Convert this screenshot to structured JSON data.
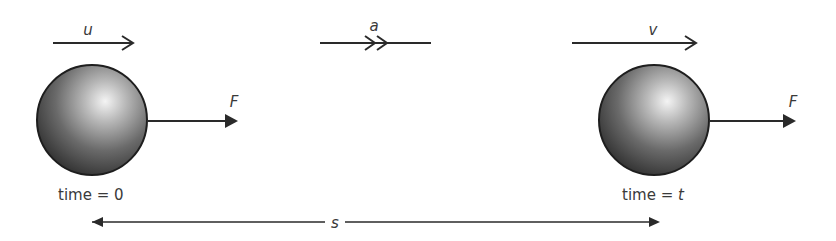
{
  "diagram": {
    "type": "physics-motion",
    "labels": {
      "initial_velocity": "u",
      "acceleration": "a",
      "final_velocity": "v",
      "force_left": "F",
      "force_right": "F",
      "displacement": "s"
    },
    "time_labels": {
      "start_prefix": "time = ",
      "start_value": "0",
      "end_prefix": "time = ",
      "end_value": "t"
    },
    "colors": {
      "stroke": "#2a2a2a",
      "text": "#3a3a3a",
      "ball_dark": "#2b2b2b",
      "ball_light": "#f4f4f4"
    }
  }
}
